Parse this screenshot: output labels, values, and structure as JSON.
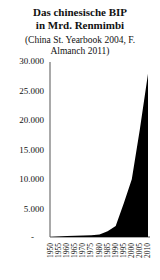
{
  "chart_data": {
    "type": "area",
    "subtitle": "(China St. Yearbook 2004, F. Almanch 2011)",
    "xlabel": "",
    "ylabel": "",
    "ylim": [
      0,
      30000
    ],
    "yticks": [
      "30.000",
      "25.000",
      "20.000",
      "15.000",
      "10.000",
      "5.000",
      "-"
    ],
    "x": [
      1950,
      1955,
      1960,
      1965,
      1970,
      1975,
      1980,
      1985,
      1990,
      1995,
      2000,
      2005,
      2010
    ],
    "series": [
      {
        "name": "BIP",
        "values": [
          0,
          100,
          150,
          200,
          250,
          300,
          450,
          1000,
          1900,
          5800,
          9900,
          18500,
          28000
        ]
      }
    ],
    "grid": false,
    "legend": null,
    "fill_color": "#000000"
  },
  "title_line1": "Das chinesische BIP",
  "title_line2": "in Mrd. Renmimbi",
  "subtitle_line1": "(China St. Yearbook 2004,  F.",
  "subtitle_line2": "Almanch 2011)",
  "y_labels": [
    "30.000",
    "25.000",
    "20.000",
    "15.000",
    "10.000",
    "5.000",
    "-"
  ],
  "x_labels": [
    "1950",
    "1955",
    "1960",
    "1965",
    "1970",
    "1975",
    "1980",
    "1985",
    "1990",
    "1995",
    "2000",
    "2005",
    "2010"
  ]
}
